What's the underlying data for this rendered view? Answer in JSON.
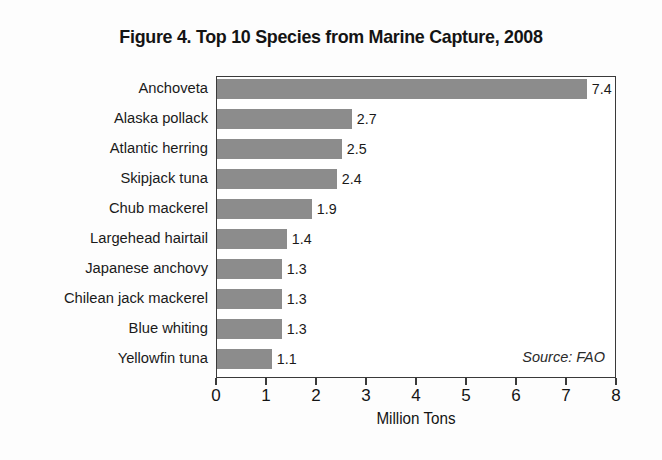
{
  "chart_data": {
    "type": "bar",
    "orientation": "horizontal",
    "title": "Figure 4. Top 10 Species from Marine Capture, 2008",
    "xlabel": "Million Tons",
    "ylabel": "",
    "xlim": [
      0,
      8
    ],
    "xticks": [
      0,
      1,
      2,
      3,
      4,
      5,
      6,
      7,
      8
    ],
    "xtick_labels": [
      "0",
      "1",
      "2",
      "3",
      "4",
      "5",
      "6",
      "7",
      "8"
    ],
    "grid": false,
    "legend": null,
    "annotation": "Source: FAO",
    "bar_color": "#8c8c8c",
    "categories": [
      "Anchoveta",
      "Alaska pollack",
      "Atlantic herring",
      "Skipjack tuna",
      "Chub mackerel",
      "Largehead hairtail",
      "Japanese anchovy",
      "Chilean jack mackerel",
      "Blue whiting",
      "Yellowfin tuna"
    ],
    "values": [
      7.4,
      2.7,
      2.5,
      2.4,
      1.9,
      1.4,
      1.3,
      1.3,
      1.3,
      1.1
    ],
    "value_labels": [
      "7.4",
      "2.7",
      "2.5",
      "2.4",
      "1.9",
      "1.4",
      "1.3",
      "1.3",
      "1.3",
      "1.1"
    ]
  }
}
